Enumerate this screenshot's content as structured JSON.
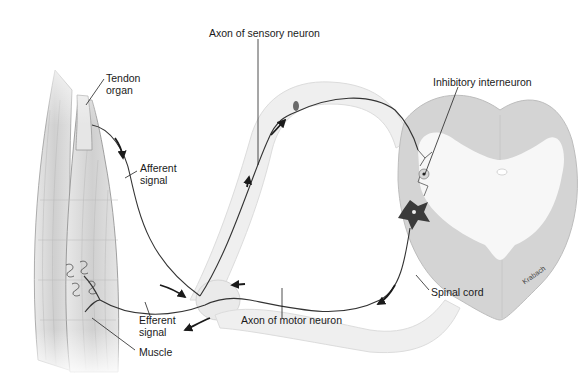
{
  "diagram": {
    "labels": {
      "tendon_organ": [
        "Tendon",
        "organ"
      ],
      "afferent_signal": [
        "Afferent",
        "signal"
      ],
      "axon_sensory": "Axon of sensory neuron",
      "inhibitory_interneuron": "Inhibitory interneuron",
      "efferent_signal": [
        "Efferent",
        "signal"
      ],
      "muscle": "Muscle",
      "axon_motor": "Axon of motor neuron",
      "spinal_cord": "Spinal cord",
      "artist": "Krabach"
    },
    "colors": {
      "muscle_fill": "#d8d8d8",
      "nerve_fill": "#ececec",
      "cord_white_matter": "#cfcfcf",
      "cord_gray_matter": "#f6f6f6",
      "neuron": "#3a3a3a",
      "line": "#222222"
    }
  }
}
